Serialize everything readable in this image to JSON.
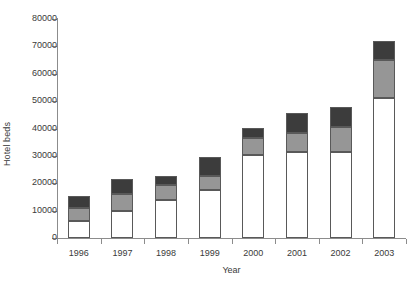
{
  "chart_data": {
    "type": "bar",
    "subtype": "stacked-bar",
    "title": "",
    "xlabel": "Year",
    "ylabel": "Hotel beds",
    "categories": [
      "1996",
      "1997",
      "1998",
      "1999",
      "2000",
      "2001",
      "2002",
      "2003"
    ],
    "ylim": [
      0,
      80000
    ],
    "ytick_values": [
      0,
      10000,
      20000,
      30000,
      40000,
      50000,
      60000,
      70000,
      80000
    ],
    "ytick_labels": [
      "0",
      "10000",
      "20000",
      "30000",
      "40000",
      "50000",
      "60000",
      "70000",
      "80000"
    ],
    "grid": false,
    "legend": "none",
    "series": [
      {
        "name": "segment-bottom",
        "color": "#ffffff",
        "values": [
          6200,
          10000,
          13800,
          17500,
          30300,
          31500,
          31500,
          51000
        ]
      },
      {
        "name": "segment-middle",
        "color": "#969696",
        "values": [
          4700,
          6000,
          5500,
          5100,
          6200,
          7000,
          9000,
          14000
        ]
      },
      {
        "name": "segment-top",
        "color": "#3c3c3c",
        "values": [
          4300,
          5500,
          3300,
          7000,
          3700,
          7000,
          7500,
          7000
        ]
      }
    ],
    "totals": [
      15200,
      21500,
      22600,
      29600,
      40200,
      45500,
      48000,
      72000
    ],
    "colors": {
      "axis": "#8c8c8c",
      "text": "#3a3a3a",
      "bar_outline": "#595959",
      "background": "#ffffff"
    }
  }
}
